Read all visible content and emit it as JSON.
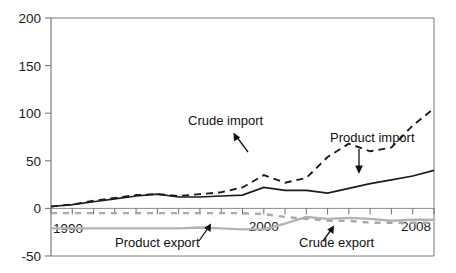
{
  "chart_data": {
    "type": "line",
    "title": "",
    "xlabel": "",
    "ylabel": "",
    "xlim": [
      1990,
      2008
    ],
    "ylim": [
      -50,
      200
    ],
    "yticks": [
      -50,
      0,
      50,
      100,
      150,
      200
    ],
    "ytick_labels": [
      "-50",
      "0",
      "50",
      "100",
      "150",
      "200"
    ],
    "xticks": [
      1990,
      1991,
      1992,
      1993,
      1994,
      1995,
      1996,
      1997,
      1998,
      1999,
      2000,
      2001,
      2002,
      2003,
      2004,
      2005,
      2006,
      2007,
      2008
    ],
    "xtick_labels_shown": [
      "1990",
      "2000",
      "2008"
    ],
    "xtick_labels_shown_values": [
      1990,
      2000,
      2008
    ],
    "grid": false,
    "legend_position": "inline-annotations",
    "x": [
      1990,
      1991,
      1992,
      1993,
      1994,
      1995,
      1996,
      1997,
      1998,
      1999,
      2000,
      2001,
      2002,
      2003,
      2004,
      2005,
      2006,
      2007,
      2008
    ],
    "series": [
      {
        "name": "Crude import",
        "style": "dashed",
        "color": "#1c1c1c",
        "values": [
          2,
          4,
          8,
          11,
          14,
          15,
          13,
          15,
          17,
          22,
          35,
          27,
          32,
          54,
          68,
          60,
          64,
          87,
          105
        ]
      },
      {
        "name": "Product import",
        "style": "solid",
        "color": "#1c1c1c",
        "values": [
          2,
          4,
          7,
          10,
          13,
          15,
          12,
          12,
          13,
          14,
          22,
          19,
          19,
          16,
          21,
          26,
          30,
          34,
          40
        ]
      },
      {
        "name": "Product export",
        "style": "solid",
        "color": "#b3b3b3",
        "values": [
          -21,
          -21,
          -21,
          -21,
          -21,
          -21,
          -21,
          -20,
          -21,
          -22,
          -22,
          -16,
          -9,
          -11,
          -10,
          -11,
          -13,
          -12,
          -12
        ]
      },
      {
        "name": "Crude export",
        "style": "dashed",
        "color": "#a9a9a9",
        "values": [
          -5,
          -5,
          -5,
          -5,
          -5,
          -5,
          -5,
          -5,
          -5,
          -5,
          -6,
          -9,
          -11,
          -13,
          -13,
          -15,
          -15,
          -15,
          -15
        ]
      }
    ],
    "series_extended_note": "values continue to 2008",
    "annotations": [
      {
        "text": "Crude import",
        "id": "crude-import"
      },
      {
        "text": "Product import",
        "id": "product-import"
      },
      {
        "text": "Product export",
        "id": "product-export"
      },
      {
        "text": "Crude export",
        "id": "crude-export"
      }
    ]
  },
  "axis": {
    "y_labels": [
      "200",
      "150",
      "100",
      "50",
      "0",
      "-50"
    ],
    "x_labels": [
      "1990",
      "2000",
      "2008"
    ]
  },
  "annotations": {
    "crude_import": "Crude import",
    "product_import": "Product import",
    "product_export": "Product export",
    "crude_export": "Crude export"
  },
  "colors": {
    "import_line": "#1c1c1c",
    "export_line": "#b3b3b3",
    "axis": "#6f6f6f",
    "background": "#ffffff"
  }
}
